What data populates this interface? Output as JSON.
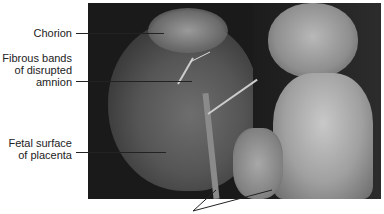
{
  "figure": {
    "photo_description": "Fetus with placenta showing amniotic bands",
    "labels": [
      {
        "id": "chorion",
        "text": "Chorion"
      },
      {
        "id": "fibrous-bands",
        "lines": [
          "Fibrous bands",
          "of disrupted",
          "amnion"
        ]
      },
      {
        "id": "fetal-surface",
        "lines": [
          "Fetal surface",
          "of placenta"
        ]
      }
    ]
  }
}
